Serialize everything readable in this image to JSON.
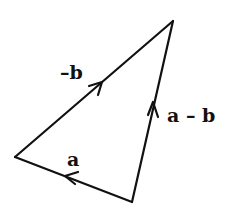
{
  "diagram": {
    "type": "vector-triangle",
    "vertices": {
      "top": [
        173,
        21
      ],
      "left": [
        15,
        157
      ],
      "bottom": [
        132,
        202
      ]
    },
    "edges": [
      {
        "id": "neg-b",
        "label": "–b",
        "from": "left",
        "to": "top"
      },
      {
        "id": "a-minus-b",
        "label": "a – b",
        "from": "bottom",
        "to": "top"
      },
      {
        "id": "a",
        "label": "a",
        "from": "bottom",
        "to": "left"
      }
    ],
    "stroke_color": "#111111",
    "background": "#ffffff"
  }
}
